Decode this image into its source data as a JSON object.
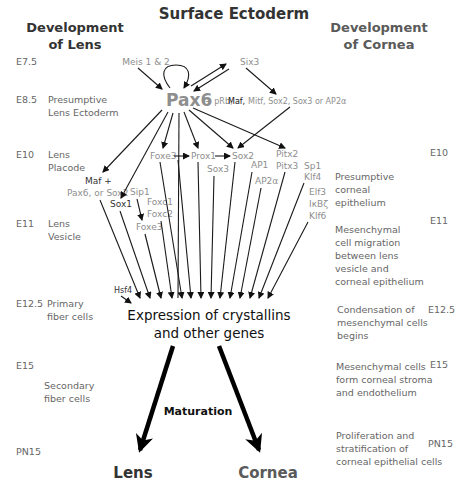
{
  "title": "Surface Ectoderm",
  "left_header": [
    "Development",
    "of Lens"
  ],
  "right_header": [
    "Development",
    "of Cornea"
  ],
  "left_stages": [
    {
      "stage": "E7.5",
      "label": []
    },
    {
      "stage": "E8.5",
      "label": [
        "Presumptive",
        "Lens Ectoderm"
      ]
    },
    {
      "stage": "E10",
      "label": [
        "Lens",
        "Placode"
      ]
    },
    {
      "stage": "E11",
      "label": [
        "Lens",
        "Vesicle"
      ]
    },
    {
      "stage": "E12.5",
      "label": [
        "Primary",
        "fiber cells"
      ]
    },
    {
      "stage": "E15",
      "label": []
    },
    {
      "stage": "",
      "label": [
        "Secondary",
        "fiber cells"
      ]
    },
    {
      "stage": "PN15",
      "label": []
    }
  ],
  "right_stages": [
    {
      "stage": "E10",
      "label": [
        "Presumptive",
        "corneal",
        "epithelium"
      ]
    },
    {
      "stage": "E11",
      "label": [
        "Mesenchymal",
        "cell migration",
        "between lens",
        "vesicle and",
        "corneal epithelium"
      ]
    },
    {
      "stage": "E12.5",
      "label": [
        "Condensation of",
        "mesenchymal cells",
        "begins"
      ]
    },
    {
      "stage": "E15",
      "label": [
        "Mesenchymal cells",
        "form corneal stroma",
        "and endothelium"
      ]
    },
    {
      "stage": "PN15",
      "label": [
        "Proliferation and",
        "stratification of",
        "corneal epithelial cells"
      ]
    }
  ],
  "genes": {
    "meis": "Meis 1 & 2",
    "six3": "Six3",
    "pax6": "Pax6",
    "pax6_partners_prefix": "+ pRb,",
    "pax6_partners_maf": "Maf,",
    "pax6_partners_suffix": "Mitf, Sox2, Sox3 or AP2α",
    "foxe3_a": "Foxe3",
    "prox1": "Prox1",
    "sox2": "Sox2",
    "sox3": "Sox3",
    "ap1": "AP1",
    "pitx2": "Pitx2",
    "pitx3": "Pitx3",
    "ap2a": "AP2α",
    "sp1": "Sp1",
    "klf4": "Klf4",
    "elf3": "Elf3",
    "ikbz": "IκBζ",
    "klf6": "Klf6",
    "maf_plus": "Maf +",
    "maf_partners": "Pax6, or Sox2",
    "sip1": "Sip1",
    "sox1": "Sox1",
    "foxc1": "Foxc1",
    "foxc2": "Foxc2",
    "foxe3_b": "Foxe3",
    "hsf4": "Hsf4"
  },
  "center": {
    "expression_line1": "Expression of crystallins",
    "expression_line2": "and other genes",
    "maturation": "Maturation"
  },
  "outcomes": {
    "lens": "Lens",
    "cornea": "Cornea"
  },
  "colors": {
    "dark_text": "#333333",
    "grey_text": "#8e8e8e",
    "arrow": "#111111"
  }
}
